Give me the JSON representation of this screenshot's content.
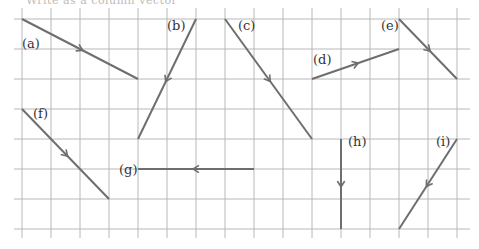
{
  "header": {
    "cut_off_text": "Write as a column vector"
  },
  "grid": {
    "x0": 22,
    "y0": 19,
    "cell_w": 29,
    "cell_h": 30,
    "cols": 15,
    "rows": 7,
    "line_color": "#b8b8b8"
  },
  "vector_color": "#6e6e6e",
  "vectors": [
    {
      "label": "(a)",
      "from": [
        0,
        0
      ],
      "to": [
        4,
        2
      ],
      "label_pos": [
        22,
        48
      ]
    },
    {
      "label": "(b)",
      "from": [
        6,
        0
      ],
      "to": [
        4,
        4
      ],
      "label_pos": [
        167,
        30
      ]
    },
    {
      "label": "(c)",
      "from": [
        7,
        0
      ],
      "to": [
        10,
        4
      ],
      "label_pos": [
        238,
        30
      ]
    },
    {
      "label": "(d)",
      "from": [
        10,
        2
      ],
      "to": [
        13,
        1
      ],
      "label_pos": [
        313,
        64
      ]
    },
    {
      "label": "(e)",
      "from": [
        13,
        0
      ],
      "to": [
        15,
        2
      ],
      "label_pos": [
        381,
        30
      ]
    },
    {
      "label": "(f)",
      "from": [
        0,
        3
      ],
      "to": [
        3,
        6
      ],
      "label_pos": [
        33,
        118
      ]
    },
    {
      "label": "(g)",
      "from": [
        8,
        5
      ],
      "to": [
        4,
        5
      ],
      "label_pos": [
        119,
        174
      ]
    },
    {
      "label": "(h)",
      "from": [
        11,
        4
      ],
      "to": [
        11,
        7
      ],
      "label_pos": [
        348,
        146
      ]
    },
    {
      "label": "(i)",
      "from": [
        15,
        4
      ],
      "to": [
        13,
        7
      ],
      "label_pos": [
        436,
        146
      ]
    }
  ]
}
